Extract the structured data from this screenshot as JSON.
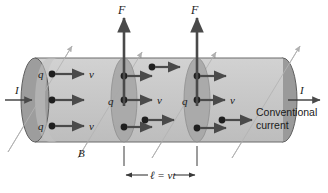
{
  "figure": {
    "background_color": "#ffffff",
    "width": 328,
    "height": 193
  },
  "colors": {
    "cylinder_body": "#c9c9c9",
    "cylinder_body_light": "#d4d4d4",
    "end_cap_dark": "#9a9a9a",
    "disc_mid": "#a8a8a8",
    "outline": "#5a5a5a",
    "arrow_dark": "#4a4a4a",
    "field_line": "#b0b0b0",
    "charge_dot": "#1f1f1f",
    "text": "#1a1a1a"
  },
  "labels": {
    "force_left": "F",
    "force_right": "F",
    "current_in": "I",
    "current_out": "I",
    "magnetic_field": "B",
    "conventional_current_line1": "Conventional",
    "conventional_current_line2": "current",
    "length_equation": "ℓ = vt",
    "charge": "q",
    "velocity": "v"
  },
  "charge_labels": [
    {
      "name": "q-left-top",
      "text": "q",
      "x": 41,
      "y": 78
    },
    {
      "name": "q-left-bottom",
      "text": "q",
      "x": 41,
      "y": 129
    },
    {
      "name": "q-disc1-middle",
      "text": "q",
      "x": 111,
      "y": 105
    },
    {
      "name": "q-disc2-middle",
      "text": "q",
      "x": 185,
      "y": 105
    }
  ],
  "velocity_labels": [
    {
      "name": "v-left-top",
      "text": "v",
      "x": 92,
      "y": 78
    },
    {
      "name": "v-left-bottom",
      "text": "v",
      "x": 92,
      "y": 129
    },
    {
      "name": "v-disc1-middle",
      "text": "v",
      "x": 160,
      "y": 105
    },
    {
      "name": "v-disc2-middle",
      "text": "v",
      "x": 232,
      "y": 105
    }
  ],
  "force_arrows": [
    {
      "name": "force-arrow-left",
      "x": 124,
      "y_top": 18,
      "y_bottom": 106,
      "label_x": 120,
      "label_y": 13
    },
    {
      "name": "force-arrow-right",
      "x": 197,
      "y_top": 18,
      "y_bottom": 106,
      "label_x": 193,
      "label_y": 13
    }
  ],
  "field_lines": [
    {
      "name": "b-field-line-1",
      "x1": 8,
      "y1": 152,
      "x2": 72,
      "y2": 46
    },
    {
      "name": "b-field-line-2",
      "x1": 78,
      "y1": 158,
      "x2": 142,
      "y2": 52
    },
    {
      "name": "b-field-line-3",
      "x1": 152,
      "y1": 158,
      "x2": 216,
      "y2": 52
    },
    {
      "name": "b-field-line-4",
      "x1": 232,
      "y1": 158,
      "x2": 300,
      "y2": 46
    }
  ],
  "dimension": {
    "name": "length-dimension",
    "x_left": 124,
    "x_right": 197,
    "y": 172,
    "tick_top": 144,
    "tick_bottom": 165,
    "label_x": 160,
    "label_y": 176
  },
  "cylinder": {
    "left_x": 35,
    "right_x": 283,
    "top_y": 58,
    "bottom_y": 142,
    "cap_rx": 14,
    "cap_ry": 42
  },
  "discs": [
    {
      "name": "charge-disc-1",
      "cx": 124,
      "ry": 42,
      "rx": 13
    },
    {
      "name": "charge-disc-2",
      "cx": 197,
      "ry": 42,
      "rx": 13
    }
  ]
}
